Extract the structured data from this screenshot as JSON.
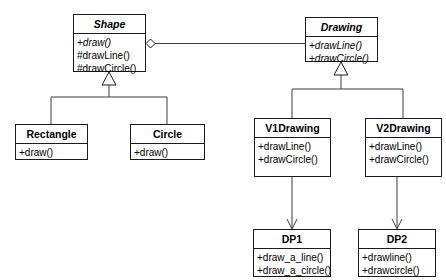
{
  "diagram": {
    "type": "uml-class-diagram",
    "background_color": "#ffffff",
    "line_color": "#3c3c3c",
    "border_color": "#1b1b1b",
    "classes": [
      {
        "id": "shape",
        "name": "Shape",
        "abstract": true,
        "operations": [
          {
            "text": "+draw()",
            "abstract": true
          },
          {
            "text": "#drawLine()",
            "abstract": false
          },
          {
            "text": "#drawCircle()",
            "abstract": false
          }
        ]
      },
      {
        "id": "drawing",
        "name": "Drawing",
        "abstract": true,
        "operations": [
          {
            "text": "+drawLine()",
            "abstract": true
          },
          {
            "text": "+drawCircle()",
            "abstract": true
          }
        ]
      },
      {
        "id": "rectangle",
        "name": "Rectangle",
        "abstract": false,
        "operations": [
          {
            "text": "+draw()",
            "abstract": false
          }
        ]
      },
      {
        "id": "circle",
        "name": "Circle",
        "abstract": false,
        "operations": [
          {
            "text": "+draw()",
            "abstract": false
          }
        ]
      },
      {
        "id": "v1drawing",
        "name": "V1Drawing",
        "abstract": false,
        "operations": [
          {
            "text": "+drawLine()",
            "abstract": false
          },
          {
            "text": "+drawCircle()",
            "abstract": false
          }
        ]
      },
      {
        "id": "v2drawing",
        "name": "V2Drawing",
        "abstract": false,
        "operations": [
          {
            "text": "+drawLine()",
            "abstract": false
          },
          {
            "text": "+drawCircle()",
            "abstract": false
          }
        ]
      },
      {
        "id": "dp1",
        "name": "DP1",
        "abstract": false,
        "operations": [
          {
            "text": "+draw_a_line()",
            "abstract": false
          },
          {
            "text": "+draw_a_circle()",
            "abstract": false
          }
        ]
      },
      {
        "id": "dp2",
        "name": "DP2",
        "abstract": false,
        "operations": [
          {
            "text": "+drawline()",
            "abstract": false
          },
          {
            "text": "+drawcircle()",
            "abstract": false
          }
        ]
      }
    ],
    "relationships": [
      {
        "kind": "aggregation",
        "from": "shape",
        "to": "drawing"
      },
      {
        "kind": "generalization",
        "from": "rectangle",
        "to": "shape"
      },
      {
        "kind": "generalization",
        "from": "circle",
        "to": "shape"
      },
      {
        "kind": "generalization",
        "from": "v1drawing",
        "to": "drawing"
      },
      {
        "kind": "generalization",
        "from": "v2drawing",
        "to": "drawing"
      },
      {
        "kind": "association",
        "from": "v1drawing",
        "to": "dp1"
      },
      {
        "kind": "association",
        "from": "v2drawing",
        "to": "dp2"
      }
    ]
  }
}
